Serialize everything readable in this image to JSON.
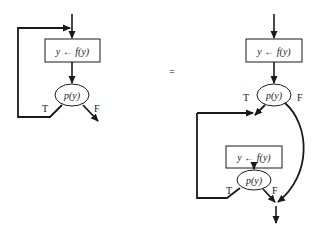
{
  "diagram": {
    "left": {
      "assign_box": {
        "text": "y ← f(y)"
      },
      "test": {
        "text": "p(y)"
      },
      "true_label": "T",
      "false_label": "F"
    },
    "equals": "=",
    "right": {
      "assign_box_1": {
        "text": "y ← f(y)"
      },
      "test_1": {
        "text": "p(y)"
      },
      "true_label_1": "T",
      "false_label_1": "F",
      "assign_box_2": {
        "text": "y ← f(y)"
      },
      "test_2": {
        "text": "p(y)"
      },
      "true_label_2": "T",
      "false_label_2": "F"
    },
    "colors": {
      "stroke": "#1a1a1a",
      "background": "#ffffff"
    }
  }
}
